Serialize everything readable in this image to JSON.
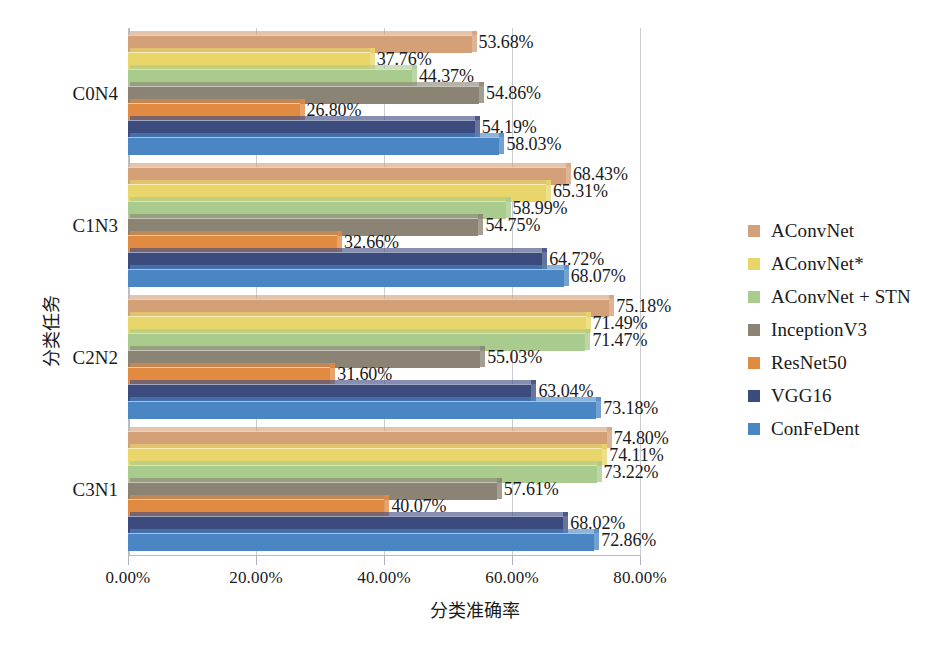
{
  "chart_data": {
    "type": "bar",
    "orientation": "horizontal",
    "title": "",
    "xlabel": "分类准确率",
    "ylabel": "分类任务",
    "xlim": [
      0,
      80
    ],
    "xticks": [
      "0.00%",
      "20.00%",
      "40.00%",
      "60.00%",
      "80.00%"
    ],
    "xtick_values": [
      0,
      20,
      40,
      60,
      80
    ],
    "grid": true,
    "legend_position": "right",
    "categories": [
      "C0N4",
      "C1N3",
      "C2N2",
      "C3N1"
    ],
    "series": [
      {
        "name": "AConvNet",
        "color": "#d4a077",
        "values": [
          53.68,
          68.43,
          75.18,
          74.8
        ],
        "labels": [
          "53.68%",
          "68.43%",
          "75.18%",
          "74.80%"
        ]
      },
      {
        "name": "AConvNet*",
        "color": "#e8d66a",
        "values": [
          37.76,
          65.31,
          71.49,
          74.11
        ],
        "labels": [
          "37.76%",
          "65.31%",
          "71.49%",
          "74.11%"
        ]
      },
      {
        "name": "AConvNet + STN",
        "color": "#a9cb8e",
        "values": [
          44.37,
          58.99,
          71.47,
          73.22
        ],
        "labels": [
          "44.37%",
          "58.99%",
          "71.47%",
          "73.22%"
        ]
      },
      {
        "name": "InceptionV3",
        "color": "#8b8475",
        "values": [
          54.86,
          54.75,
          55.03,
          57.61
        ],
        "labels": [
          "54.86%",
          "54.75%",
          "55.03%",
          "57.61%"
        ]
      },
      {
        "name": "ResNet50",
        "color": "#e18b42",
        "values": [
          26.8,
          32.66,
          31.6,
          40.07
        ],
        "labels": [
          "26.80%",
          "32.66%",
          "31.60%",
          "40.07%"
        ]
      },
      {
        "name": "VGG16",
        "color": "#3c4b7e",
        "values": [
          54.19,
          64.72,
          63.04,
          68.02
        ],
        "labels": [
          "54.19%",
          "64.72%",
          "63.04%",
          "68.02%"
        ]
      },
      {
        "name": "ConFeDent",
        "color": "#4b86c4",
        "values": [
          58.03,
          68.07,
          73.18,
          72.86
        ],
        "labels": [
          "58.03%",
          "68.07%",
          "73.18%",
          "72.86%"
        ]
      }
    ]
  },
  "axes": {
    "x_title": "分类准确率",
    "y_title": "分类任务"
  },
  "colors": {
    "grid": "#c9cdd2",
    "axis": "#b9bdc2",
    "text": "#1a1a1a"
  }
}
